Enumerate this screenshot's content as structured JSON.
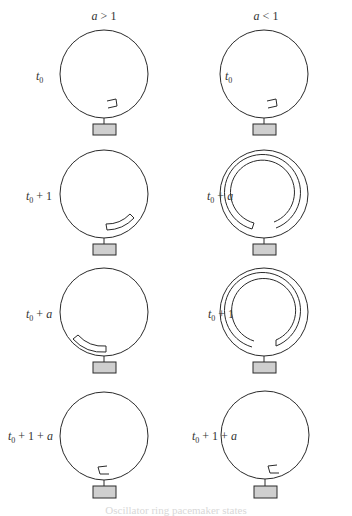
{
  "diagram": {
    "columns": [
      {
        "header": "a > 1",
        "header_var": "a",
        "header_rel": " > 1",
        "cx": 104
      },
      {
        "header": "a < 1",
        "header_var": "a",
        "header_rel": " < 1",
        "cx": 264
      }
    ],
    "rows": [
      {
        "cy": 74,
        "left_label": "t0",
        "right_label": "t0",
        "left_state": "small-pulse",
        "right_state": "small-pulse"
      },
      {
        "cy": 194,
        "left_label": "t0 + 1",
        "right_label": "t0 + a",
        "left_state": "arc-pulse-right",
        "right_state": "spiral-loops"
      },
      {
        "cy": 312,
        "left_label": "t0 + a",
        "right_label": "t0 + 1",
        "left_state": "arc-pulse-left",
        "right_state": "spiral-loops"
      },
      {
        "cy": 432,
        "left_label": "t0 + 1 + a",
        "right_label": "t0 + 1 + a",
        "left_state": "small-pulse-reversed",
        "right_state": "small-pulse-reversed"
      }
    ],
    "labels": {
      "r0l": {
        "t": "t",
        "sub": "0",
        "rest": ""
      },
      "r0r": {
        "t": "t",
        "sub": "0",
        "rest": ""
      },
      "r1l": {
        "t": "t",
        "sub": "0",
        "rest": " + 1"
      },
      "r1r": {
        "t": "t",
        "sub": "0",
        "rest": " + ",
        "var": "a"
      },
      "r2l": {
        "t": "t",
        "sub": "0",
        "rest": " + ",
        "var": "a"
      },
      "r2r": {
        "t": "t",
        "sub": "0",
        "rest": " + 1"
      },
      "r3l": {
        "t": "t",
        "sub": "0",
        "rest": " + 1 + ",
        "var": "a"
      },
      "r3r": {
        "t": "t",
        "sub": "0",
        "rest": " + 1 + ",
        "var": "a"
      }
    },
    "caption": "Oscillator ring pacemaker states",
    "colors": {
      "stroke": "#2a2a2a",
      "box_fill": "#cfcfcf",
      "caption": "#d8d8d8"
    }
  }
}
